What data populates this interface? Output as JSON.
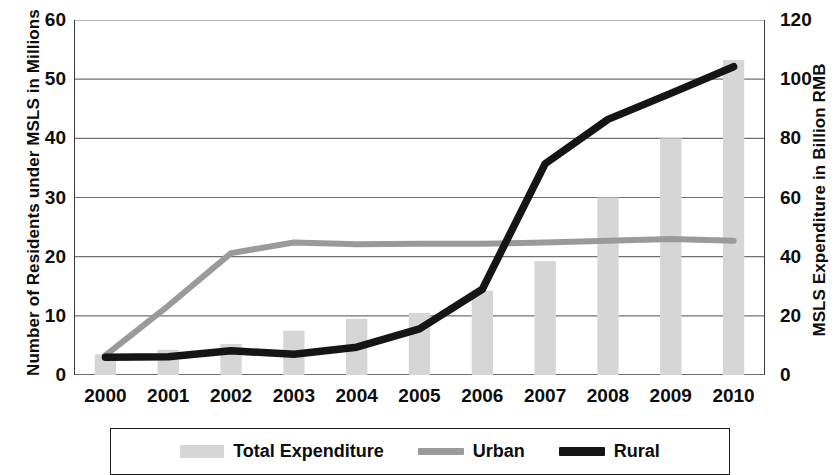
{
  "chart_data": {
    "type": "bar",
    "title": "",
    "subtitle": "",
    "xlabel": "",
    "ylabel": "Number of Residents under MSLS in Millions",
    "y2label": "MSLS Expenditure in Billion RMB",
    "categories": [
      "2000",
      "2001",
      "2002",
      "2003",
      "2004",
      "2005",
      "2006",
      "2007",
      "2008",
      "2009",
      "2010"
    ],
    "ylim": [
      0,
      60
    ],
    "y2lim": [
      0,
      120
    ],
    "yticks": [
      "60",
      "50",
      "40",
      "30",
      "20",
      "10",
      "0"
    ],
    "ytick_values": [
      60,
      50,
      40,
      30,
      20,
      10,
      0
    ],
    "y2ticks": [
      "120",
      "100",
      "80",
      "60",
      "40",
      "20",
      "0"
    ],
    "y2tick_values": [
      120,
      100,
      80,
      60,
      40,
      20,
      0
    ],
    "grid": true,
    "grid_axis": "y",
    "legend_position": "bottom",
    "series": [
      {
        "name": "Total Expenditure",
        "type": "bar",
        "axis": "right",
        "units": "Billion RMB",
        "color": "#d6d6d6",
        "values": [
          7,
          8.5,
          10.5,
          15,
          19,
          21,
          28.5,
          38.5,
          60,
          80,
          106.5
        ]
      },
      {
        "name": "Urban",
        "type": "line",
        "axis": "left",
        "units": "Millions",
        "color": "#9a9a9a",
        "values": [
          3.3,
          11.7,
          20.6,
          22.4,
          22.1,
          22.2,
          22.2,
          22.4,
          22.7,
          23.0,
          22.7
        ]
      },
      {
        "name": "Rural",
        "type": "line",
        "axis": "left",
        "units": "Millions",
        "color": "#151515",
        "values": [
          3.0,
          3.1,
          4.1,
          3.5,
          4.7,
          7.8,
          14.5,
          35.7,
          43.2,
          47.6,
          52.1
        ]
      }
    ]
  },
  "legend": {
    "items": [
      {
        "label": "Total Expenditure",
        "marker": "bar-swatch"
      },
      {
        "label": "Urban",
        "marker": "line-swatch"
      },
      {
        "label": "Rural",
        "marker": "line-swatch"
      }
    ]
  }
}
